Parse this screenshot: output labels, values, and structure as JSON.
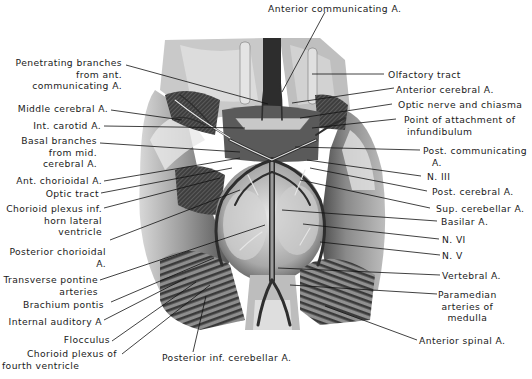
{
  "figure": {
    "type": "anatomical-illustration",
    "labels_left": [
      {
        "id": "penetrating",
        "lines": [
          "Penetrating branches",
          "from ant.",
          "communicating A."
        ]
      },
      {
        "id": "mca",
        "lines": [
          "Middle cerebral A."
        ]
      },
      {
        "id": "ica",
        "lines": [
          "Int. carotid A."
        ]
      },
      {
        "id": "basal",
        "lines": [
          "Basal branches",
          "from mid.",
          "cerebral A."
        ]
      },
      {
        "id": "antchor",
        "lines": [
          "Ant. chorioidal A."
        ]
      },
      {
        "id": "optract",
        "lines": [
          "Optic tract"
        ]
      },
      {
        "id": "chorplex",
        "lines": [
          "Chorioid plexus inf.",
          "horn lateral",
          "ventricle"
        ]
      },
      {
        "id": "postchor",
        "lines": [
          "Posterior chorioidal",
          "A."
        ]
      },
      {
        "id": "transpont",
        "lines": [
          "Transverse pontine",
          "arteries"
        ]
      },
      {
        "id": "brachium",
        "lines": [
          "Brachium pontis"
        ]
      },
      {
        "id": "intaud",
        "lines": [
          "Internal auditory A"
        ]
      },
      {
        "id": "flocculus",
        "lines": [
          "Flocculus"
        ]
      },
      {
        "id": "chor4",
        "lines": [
          "Chorioid plexus of",
          "fourth ventricle"
        ]
      }
    ],
    "labels_right": [
      {
        "id": "olf",
        "lines": [
          "Olfactory tract"
        ]
      },
      {
        "id": "aca",
        "lines": [
          "Anterior cerebral A."
        ]
      },
      {
        "id": "optic",
        "lines": [
          "Optic nerve and chiasma"
        ]
      },
      {
        "id": "infund",
        "lines": [
          "Point of attachment of",
          "infundibulum"
        ]
      },
      {
        "id": "pcom",
        "lines": [
          "Post. communicating",
          "A."
        ]
      },
      {
        "id": "n3",
        "lines": [
          "N. III"
        ]
      },
      {
        "id": "pca",
        "lines": [
          "Post. cerebral A."
        ]
      },
      {
        "id": "sca",
        "lines": [
          "Sup. cerebellar A."
        ]
      },
      {
        "id": "basilar",
        "lines": [
          "Basilar A."
        ]
      },
      {
        "id": "n6",
        "lines": [
          "N. VI"
        ]
      },
      {
        "id": "n5",
        "lines": [
          "N. V"
        ]
      },
      {
        "id": "vert",
        "lines": [
          "Vertebral A."
        ]
      },
      {
        "id": "paramed",
        "lines": [
          "Paramedian",
          "arteries of",
          "medulla"
        ]
      },
      {
        "id": "antspinal",
        "lines": [
          "Anterior spinal A."
        ]
      }
    ],
    "labels_top": [
      {
        "id": "acom",
        "lines": [
          "Anterior communicating A."
        ]
      }
    ],
    "labels_bottom": [
      {
        "id": "pica",
        "lines": [
          "Posterior inf. cerebellar A."
        ]
      }
    ]
  }
}
